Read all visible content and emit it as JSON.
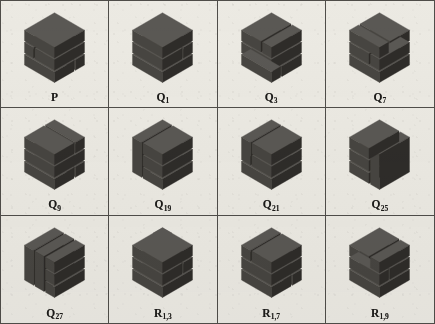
{
  "figure": {
    "background_color": "#eceae3",
    "border_color": "#4f4d49",
    "block_color_top": "#5a5854",
    "block_color_front": "#474541",
    "block_color_side": "#2e2c29",
    "rows": 3,
    "columns": 4
  },
  "cells": [
    {
      "label_base": "P",
      "label_sub": "",
      "label_full": "P",
      "icon": "block-assembly-icon",
      "variant": 0
    },
    {
      "label_base": "Q",
      "label_sub": "1",
      "label_full": "Q1",
      "icon": "block-assembly-icon",
      "variant": 1
    },
    {
      "label_base": "Q",
      "label_sub": "3",
      "label_full": "Q3",
      "icon": "block-assembly-icon",
      "variant": 2
    },
    {
      "label_base": "Q",
      "label_sub": "7",
      "label_full": "Q7",
      "icon": "block-assembly-icon",
      "variant": 3
    },
    {
      "label_base": "Q",
      "label_sub": "9",
      "label_full": "Q9",
      "icon": "block-assembly-icon",
      "variant": 4
    },
    {
      "label_base": "Q",
      "label_sub": "19",
      "label_full": "Q19",
      "icon": "block-assembly-icon",
      "variant": 5
    },
    {
      "label_base": "Q",
      "label_sub": "21",
      "label_full": "Q21",
      "icon": "block-assembly-icon",
      "variant": 6
    },
    {
      "label_base": "Q",
      "label_sub": "25",
      "label_full": "Q25",
      "icon": "block-assembly-icon",
      "variant": 7
    },
    {
      "label_base": "Q",
      "label_sub": "27",
      "label_full": "Q27",
      "icon": "block-assembly-icon",
      "variant": 8
    },
    {
      "label_base": "R",
      "label_sub": "1,3",
      "label_full": "R1,3",
      "icon": "block-assembly-icon",
      "variant": 9
    },
    {
      "label_base": "R",
      "label_sub": "1,7",
      "label_full": "R1,7",
      "icon": "block-assembly-icon",
      "variant": 10
    },
    {
      "label_base": "R",
      "label_sub": "1,9",
      "label_full": "R1,9",
      "icon": "block-assembly-icon",
      "variant": 11
    }
  ]
}
